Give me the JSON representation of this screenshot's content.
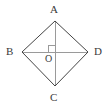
{
  "figure": {
    "type": "geometry-diagram",
    "shape": "rhombus",
    "title": "",
    "background_color": "#ffffff",
    "canvas": {
      "width": 111,
      "height": 108
    },
    "vertices": [
      {
        "id": "A",
        "label": "A",
        "role": "top-vertex",
        "x": 55,
        "y": 21
      },
      {
        "id": "B",
        "label": "B",
        "role": "left-vertex",
        "x": 22,
        "y": 52
      },
      {
        "id": "C",
        "label": "C",
        "role": "bottom-vertex",
        "x": 55,
        "y": 86
      },
      {
        "id": "D",
        "label": "D",
        "role": "right-vertex",
        "x": 88,
        "y": 52
      },
      {
        "id": "O",
        "label": "O",
        "role": "diagonal-intersection",
        "x": 55,
        "y": 52
      }
    ],
    "sides": [
      {
        "from": "A",
        "to": "B",
        "color": "#444444",
        "width": 1
      },
      {
        "from": "B",
        "to": "C",
        "color": "#444444",
        "width": 1
      },
      {
        "from": "C",
        "to": "D",
        "color": "#444444",
        "width": 1
      },
      {
        "from": "D",
        "to": "A",
        "color": "#444444",
        "width": 1
      }
    ],
    "diagonals": [
      {
        "from": "A",
        "to": "C",
        "color": "#9a9a9a",
        "width": 1
      },
      {
        "from": "B",
        "to": "D",
        "color": "#9a9a9a",
        "width": 1
      }
    ],
    "right_angle_marker": {
      "at": "O",
      "quadrant": "upper-left",
      "size": 7,
      "color": "#9a9a9a",
      "label": "right-angle"
    },
    "label_color": "#3a3a3a",
    "side_color": "#444444",
    "diagonal_color": "#9a9a9a"
  }
}
